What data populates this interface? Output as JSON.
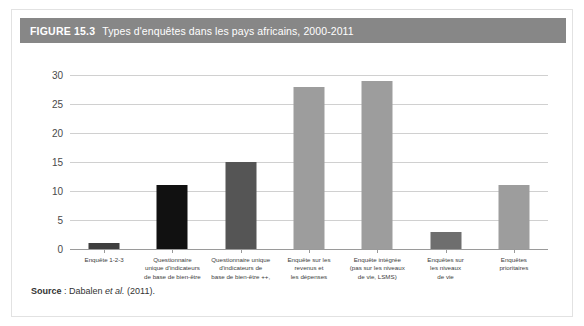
{
  "figure": {
    "number": "FIGURE 15.3",
    "title": "Types d'enquêtes dans les pays africains, 2000-2011"
  },
  "source": {
    "label": "Source",
    "separator": " : ",
    "text_before": "Dabalen ",
    "italic": "et al.",
    "text_after": " (2011)."
  },
  "colors": {
    "title_bar": "#878787",
    "panel_border": "#e2e2e2",
    "gridline": "#d0d0d0",
    "axis": "#9a9a9a",
    "bar_dark": "#3f3f3f",
    "bar_black": "#111111",
    "bar_mid": "#555555",
    "bar_light": "#9d9d9d"
  },
  "chart_data": {
    "type": "bar",
    "title": "Types d'enquêtes dans les pays africains, 2000-2011",
    "xlabel": "",
    "ylabel": "",
    "ylim": [
      0,
      30
    ],
    "yticks": [
      0,
      5,
      10,
      15,
      20,
      25,
      30
    ],
    "ytick_labels": [
      "0",
      "5",
      "10",
      "15",
      "20",
      "25",
      "30"
    ],
    "grid": true,
    "legend": "none",
    "categories": [
      "Enquête 1-2-3",
      "Questionnaire unique d'indicateurs de base de bien-être",
      "Questionnaire unique d'indicateurs de base de bien-être ++,",
      "Enquête sur les revenus et les dépenses",
      "Enquête intégrée (pas sur les niveaux de vie, LSMS)",
      "Enquêtes sur les niveaux de vie",
      "Enquêtes prioritaires"
    ],
    "category_lines": [
      [
        "Enquête 1-2-3"
      ],
      [
        "Questionnaire",
        "unique d'indicateurs",
        "de base de bien-être"
      ],
      [
        "Questionnaire unique",
        "d'indicateurs de",
        "base de bien-être ++,"
      ],
      [
        "Enquête sur les",
        "revenus et",
        "les dépenses"
      ],
      [
        "Enquête intégrée",
        "(pas sur les niveaux",
        "de vie, LSMS)"
      ],
      [
        "Enquêtes sur",
        "les niveaux",
        "de vie"
      ],
      [
        "Enquêtes",
        "prioritaires"
      ]
    ],
    "values": [
      1,
      11,
      15,
      28,
      29,
      3,
      11
    ],
    "bar_colors": [
      "#3f3f3f",
      "#111111",
      "#555555",
      "#9d9d9d",
      "#9d9d9d",
      "#6e6e6e",
      "#9d9d9d"
    ]
  }
}
